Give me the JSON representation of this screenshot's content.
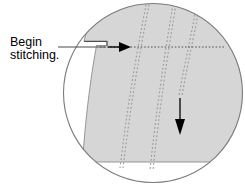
{
  "figure": {
    "type": "sewing-instruction-diagram",
    "canvas": {
      "width": 244,
      "height": 190,
      "background": "#ffffff"
    },
    "callout": {
      "line1": "Begin",
      "line2": "stitching.",
      "full_text": "Begin stitching.",
      "text_color": "#000000",
      "leader_line": {
        "description": "horizontal leader from text to fabric edge step",
        "color": "#4d4d4d"
      }
    },
    "magnifier": {
      "shape": "circle",
      "center_x": 153,
      "center_y": 93,
      "radius": 90,
      "stroke": "#7a7a7a",
      "fill": "#ffffff"
    },
    "fabric": {
      "fill": "#d6d6d6",
      "stroke": "#8c8c8c",
      "description": "curved fabric panel with stepped edge at upper left"
    },
    "stitch_lines": [
      {
        "name": "seam-line-1",
        "style": "dotted",
        "color": "#9a9a9a"
      },
      {
        "name": "seam-line-2",
        "style": "dotted",
        "color": "#9a9a9a"
      },
      {
        "name": "seam-line-3",
        "style": "dotted",
        "color": "#9a9a9a"
      }
    ],
    "stitching_path": {
      "name": "horizontal-stitch-line",
      "style": "dotted",
      "color": "#555555",
      "start_x": 105,
      "end_x": 222,
      "y": 47
    },
    "arrows": [
      {
        "name": "begin-stitching-arrow",
        "direction": "right",
        "tip_x": 129,
        "tip_y": 47,
        "color": "#000000"
      },
      {
        "name": "stitch-direction-arrow",
        "direction": "down",
        "tip_x": 179,
        "tip_y": 133,
        "color": "#000000"
      }
    ]
  }
}
